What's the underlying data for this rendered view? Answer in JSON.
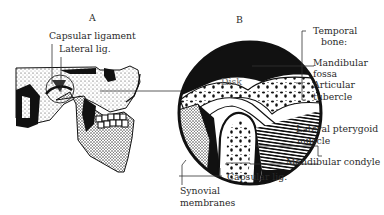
{
  "panels": {
    "a": {
      "letter": "A",
      "subject": "skull-lateral-view"
    },
    "b": {
      "letter": "B",
      "subject": "tmj-cross-section"
    }
  },
  "labels": {
    "capsular_ligament": "Capsular ligament",
    "lateral_lig": "Lateral lig.",
    "disk": "Disk",
    "temporal_bone_line1": "Temporal",
    "temporal_bone_line2": "bone:",
    "mandibular_fossa_line1": "Mandibular",
    "mandibular_fossa_line2": "fossa",
    "articular_tubercle_line1": "Articular",
    "articular_tubercle_line2": "tubercle",
    "lateral_pterygoid_line1": "Lateral pterygoid",
    "lateral_pterygoid_line2": "muscle",
    "mandibular_condyle": "Mandibular condyle",
    "capsular_lig": "Capsular lig.",
    "synovial_line1": "Synovial",
    "synovial_line2": "membranes"
  },
  "colors": {
    "ink": "#111111",
    "paper": "#ffffff",
    "leader": "#444444"
  }
}
